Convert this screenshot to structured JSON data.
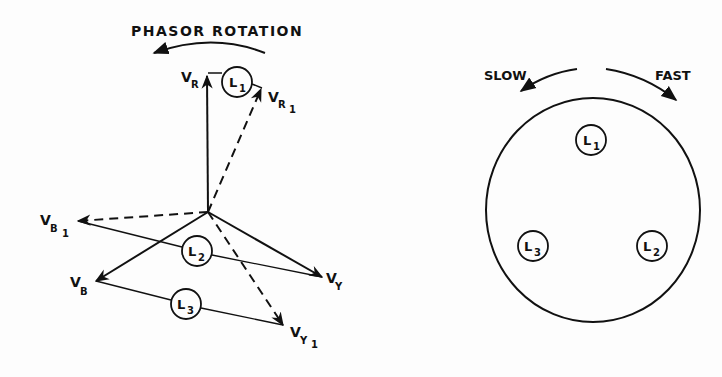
{
  "phasor_diagram": {
    "title": "PHASOR ROTATION",
    "phasors": {
      "VR": {
        "main": "V",
        "sub": "R"
      },
      "VR1": {
        "main": "V",
        "sub": "R",
        "sub2": "1"
      },
      "VB": {
        "main": "V",
        "sub": "B"
      },
      "VB1": {
        "main": "V",
        "sub": "B",
        "sub2": "1"
      },
      "VY": {
        "main": "V",
        "sub": "Y"
      },
      "VY1": {
        "main": "V",
        "sub": "Y",
        "sub2": "1"
      }
    },
    "lamps": [
      {
        "main": "L",
        "sub": "1"
      },
      {
        "main": "L",
        "sub": "2"
      },
      {
        "main": "L",
        "sub": "3"
      }
    ]
  },
  "lamp_panel": {
    "slow_label": "SLOW",
    "fast_label": "FAST",
    "lamps": [
      {
        "main": "L",
        "sub": "1"
      },
      {
        "main": "L",
        "sub": "2"
      },
      {
        "main": "L",
        "sub": "3"
      }
    ]
  },
  "colors": {
    "ink": "#111111",
    "paper": "#fdfdfd"
  }
}
